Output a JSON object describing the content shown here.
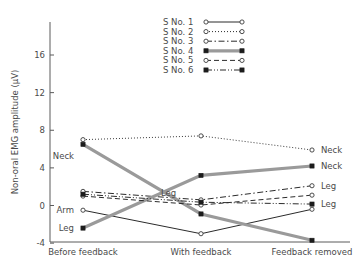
{
  "chart_data": {
    "type": "line",
    "title": "",
    "xlabel": "",
    "ylabel": "Non-oral EMG amplitude (µV)",
    "categories": [
      "Before feedback",
      "With feedback",
      "Feedback removed"
    ],
    "ylim": [
      -4,
      18
    ],
    "yticks": [
      -4,
      0,
      4,
      8,
      12,
      16
    ],
    "yticklabels": [
      "-4",
      "0",
      "4",
      "8",
      "12",
      "16"
    ],
    "grid": false,
    "legend_position": "top-center",
    "series": [
      {
        "name": "S No. 1",
        "values": [
          -0.5,
          -3.0,
          -0.4
        ],
        "style": "solid",
        "marker": "open-circle",
        "color": "#2b2b2b",
        "width": 1.0,
        "annotation_left": "Arm",
        "annotation_right": ""
      },
      {
        "name": "S No. 2",
        "values": [
          7.0,
          7.4,
          5.9
        ],
        "style": "dotted",
        "marker": "open-circle",
        "color": "#3a3a3a",
        "width": 1.0,
        "annotation_left": "",
        "annotation_right": "Neck"
      },
      {
        "name": "S No. 3",
        "values": [
          1.5,
          0.6,
          2.1
        ],
        "style": "dash-dot",
        "marker": "open-circle",
        "color": "#2b2b2b",
        "width": 1.0,
        "annotation_left": "",
        "annotation_right": "Leg"
      },
      {
        "name": "S No. 4",
        "values": [
          -2.4,
          3.2,
          4.2
        ],
        "style": "thick-gray",
        "marker": "filled-square",
        "color": "#9a9a9a",
        "width": 3.2,
        "annotation_left": "Leg",
        "annotation_right": "Neck"
      },
      {
        "name": "S No. 4b",
        "values": [
          6.5,
          -0.9,
          -3.7
        ],
        "style": "thick-gray",
        "marker": "filled-square",
        "color": "#9a9a9a",
        "width": 3.2,
        "annotation_left": "Neck",
        "annotation_right": ""
      },
      {
        "name": "S No. 5",
        "values": [
          1.0,
          0.05,
          1.1
        ],
        "style": "dashed",
        "marker": "open-circle",
        "color": "#2b2b2b",
        "width": 1.0,
        "annotation_left": "",
        "annotation_right": ""
      },
      {
        "name": "S No. 6",
        "values": [
          1.2,
          0.35,
          0.15
        ],
        "style": "dash-dot-dot",
        "marker": "filled-square",
        "color": "#2b2b2b",
        "width": 1.0,
        "annotation_left": "",
        "annotation_right": "Leg"
      }
    ],
    "annotations": [
      {
        "text": "Neck",
        "x": 0,
        "y": 5.3,
        "side": "left"
      },
      {
        "text": "Arm",
        "x": 0,
        "y": -0.5,
        "side": "left"
      },
      {
        "text": "Leg",
        "x": 0,
        "y": -2.4,
        "side": "left"
      },
      {
        "text": "Leg",
        "x": 1,
        "y": 1.35,
        "side": "mid"
      },
      {
        "text": "Neck",
        "x": 2,
        "y": 5.9,
        "side": "right"
      },
      {
        "text": "Neck",
        "x": 2,
        "y": 4.2,
        "side": "right"
      },
      {
        "text": "Leg",
        "x": 2,
        "y": 2.1,
        "side": "right"
      },
      {
        "text": "Leg",
        "x": 2,
        "y": 0.15,
        "side": "right"
      }
    ],
    "legend": [
      {
        "label": "S No. 1",
        "style": "solid",
        "marker": "open-circle"
      },
      {
        "label": "S No. 2",
        "style": "dotted",
        "marker": "open-circle"
      },
      {
        "label": "S No. 3",
        "style": "dash-dot",
        "marker": "open-circle"
      },
      {
        "label": "S No. 4",
        "style": "thick-gray",
        "marker": "filled-square"
      },
      {
        "label": "S No. 5",
        "style": "dashed",
        "marker": "open-circle"
      },
      {
        "label": "S No. 6",
        "style": "dash-dot-dot",
        "marker": "filled-square"
      }
    ]
  }
}
